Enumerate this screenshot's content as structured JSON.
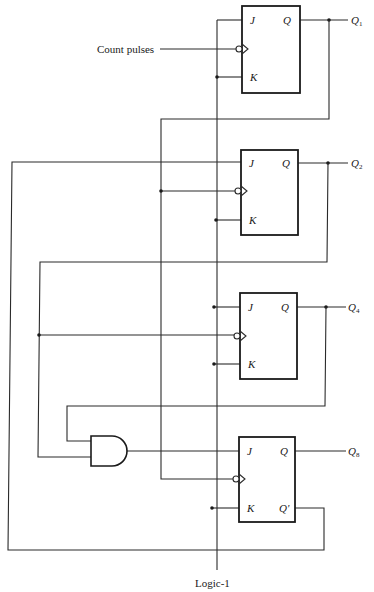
{
  "diagram": {
    "type": "4-bit BCD decade counter using JK flip-flops (circuit schematic)",
    "input_label": "Count pulses",
    "logic_label": "Logic-1",
    "flip_flops": [
      {
        "id": "ff1",
        "pins": {
          "j": "J",
          "k": "K",
          "q": "Q"
        },
        "output": {
          "name": "Q",
          "sub": "1"
        }
      },
      {
        "id": "ff2",
        "pins": {
          "j": "J",
          "k": "K",
          "q": "Q"
        },
        "output": {
          "name": "Q",
          "sub": "2"
        }
      },
      {
        "id": "ff3",
        "pins": {
          "j": "J",
          "k": "K",
          "q": "Q"
        },
        "output": {
          "name": "Q",
          "sub": "4"
        }
      },
      {
        "id": "ff4",
        "pins": {
          "j": "J",
          "k": "K",
          "q": "Q",
          "qbar": "Q'"
        },
        "output": {
          "name": "Q",
          "sub": "8"
        }
      }
    ],
    "gates": [
      {
        "id": "and1",
        "type": "AND",
        "inputs": [
          "Q2",
          "Q4"
        ],
        "output": "J of Q8 flip-flop"
      }
    ],
    "connections": [
      "Count pulses -> CLK FF1",
      "Logic-1 -> J1, K1, K2, J3, K3, K4",
      "Q1 -> CLK FF2, CLK FF4",
      "Q8' -> J2",
      "Q2 -> CLK FF3, AND input",
      "Q4 -> AND input",
      "AND output -> J4"
    ]
  }
}
